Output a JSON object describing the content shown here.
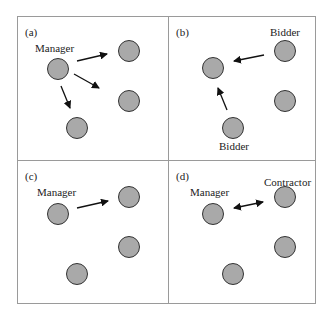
{
  "panels": [
    {
      "id": "a",
      "tag": "(a)",
      "labels": [
        "Manager"
      ]
    },
    {
      "id": "b",
      "tag": "(b)",
      "labels": [
        "Bidder",
        "Bidder"
      ]
    },
    {
      "id": "c",
      "tag": "(c)",
      "labels": [
        "Manager"
      ]
    },
    {
      "id": "d",
      "tag": "(d)",
      "labels": [
        "Manager",
        "Contractor"
      ]
    }
  ],
  "colors": {
    "node_fill": "#a9a9a9",
    "node_stroke": "#333333",
    "arrow": "#111111",
    "frame": "#9a9a9a"
  }
}
